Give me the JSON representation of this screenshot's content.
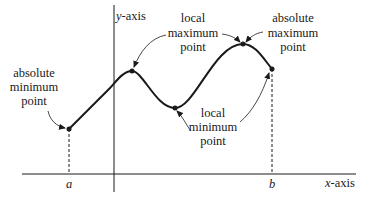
{
  "diagram": {
    "axes": {
      "x_label_var": "x",
      "x_label_rest": "-axis",
      "y_label_var": "y",
      "y_label_rest": "-axis"
    },
    "interval": {
      "a_label": "a",
      "b_label": "b"
    },
    "annotations": {
      "absolute_minimum": [
        "absolute",
        "minimum",
        "point"
      ],
      "local_maximum": [
        "local",
        "maximum",
        "point"
      ],
      "absolute_maximum": [
        "absolute",
        "maximum",
        "point"
      ],
      "local_minimum": [
        "local",
        "minimum",
        "point"
      ]
    },
    "colors": {
      "ink": "#1a1a1a",
      "background": "#ffffff"
    }
  }
}
